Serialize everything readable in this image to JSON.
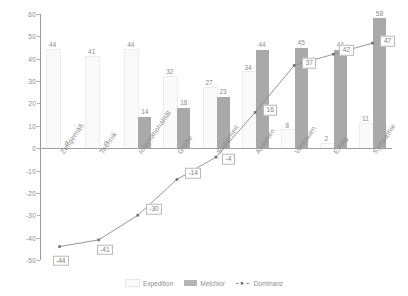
{
  "chart_data": {
    "type": "bar",
    "title": "",
    "subtitle": "",
    "xlabel": "",
    "ylabel": "",
    "ylim": [
      -50,
      60
    ],
    "ytick_step": 10,
    "yticks": [
      60,
      50,
      40,
      30,
      20,
      10,
      0,
      -10,
      -20,
      -30,
      -40,
      -50
    ],
    "grid": false,
    "legend_position": "bottom",
    "categories": [
      "Zeitgemäß",
      "Technik",
      "Internationalität",
      "Größe",
      "Sicherheit",
      "Ansehen",
      "Vertrauen",
      "Erfolg",
      "Sympathie"
    ],
    "series": [
      {
        "name": "Expedition",
        "type": "bar",
        "color": "#fafafa",
        "values": [
          44,
          41,
          44,
          32,
          27,
          34,
          8,
          2,
          11
        ]
      },
      {
        "name": "Melchior",
        "type": "bar",
        "color": "#a9a9a9",
        "values": [
          0,
          0,
          14,
          18,
          23,
          44,
          45,
          44,
          58
        ]
      },
      {
        "name": "Dominanz",
        "type": "line",
        "color": "#8a8a8a",
        "values": [
          -44,
          -41,
          -30,
          -14,
          -4,
          16,
          37,
          42,
          47
        ]
      }
    ]
  },
  "legend": {
    "items": [
      {
        "label": "Expedition",
        "marker": "light-square-swatch"
      },
      {
        "label": "Melchior",
        "marker": "dark-square-swatch"
      },
      {
        "label": "Dominanz",
        "marker": "dashed-line-marker"
      }
    ]
  },
  "colors": {
    "bar_light": "#fafafa",
    "bar_light_border": "#ededed",
    "bar_dark": "#a9a9a9",
    "line": "#8a8a8a",
    "axis": "#a0a0a0",
    "text": "#8a8a8a",
    "background": "#ffffff"
  }
}
